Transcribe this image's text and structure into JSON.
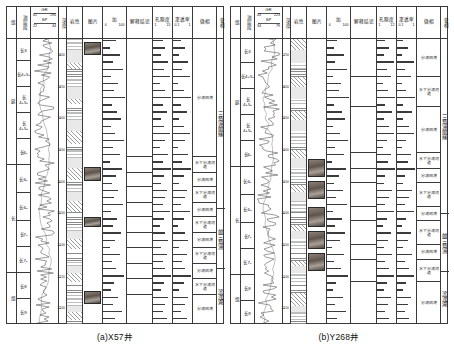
{
  "figure": {
    "panels": [
      {
        "id": "a",
        "caption": "(a)X57井",
        "headers": [
          {
            "name": "group-header",
            "label": "组",
            "type": "vertical"
          },
          {
            "name": "layer-header",
            "label": "油层段",
            "type": "vertical"
          },
          {
            "name": "curve-header",
            "label": "GR",
            "type": "curve",
            "curves": [
              {
                "name": "GR",
                "min": "61",
                "max": "190"
              },
              {
                "name": "SP",
                "min": "22",
                "max": "44"
              }
            ]
          },
          {
            "name": "depth-header",
            "label": "深度",
            "type": "vertical"
          },
          {
            "name": "lithology-header",
            "label": "岩性",
            "type": "plain"
          },
          {
            "name": "photo-header",
            "label": "图片",
            "type": "plain"
          },
          {
            "name": "gr-curve-header",
            "label": "加",
            "type": "scale",
            "min": "0",
            "max": "100"
          },
          {
            "name": "interp-header",
            "label": "解释结论",
            "type": "plain"
          },
          {
            "name": "porosity-header",
            "label": "孔隙度",
            "type": "scale",
            "min": "1",
            "max": "15"
          },
          {
            "name": "perm-header",
            "label": "渗透率",
            "type": "scale",
            "min": "0.1",
            "max": "1"
          },
          {
            "name": "microfacies-header",
            "label": "微相",
            "type": "plain"
          },
          {
            "name": "subfacies-header",
            "label": "亚相",
            "type": "vertical"
          }
        ],
        "stratigraphy": {
          "groups": [
            {
              "label": "延",
              "span": 5
            },
            {
              "label": "长",
              "span": 4
            },
            {
              "label": "组",
              "span": 3
            }
          ],
          "zones": [
            {
              "label": "长3",
              "h": 22
            },
            {
              "label": "长4+5₁",
              "h": 26
            },
            {
              "label": "长4+5₂",
              "h": 26
            },
            {
              "label": "长4+5₃",
              "h": 26
            },
            {
              "label": "长6₁",
              "h": 26
            },
            {
              "label": "长6₂",
              "h": 28
            },
            {
              "label": "长6₃",
              "h": 28
            },
            {
              "label": "长7₁",
              "h": 26
            },
            {
              "label": "长7₂",
              "h": 26
            },
            {
              "label": "长8",
              "h": 26
            },
            {
              "label": "长9",
              "h": 25
            }
          ]
        },
        "depth_labels": [
          "1800",
          "1850",
          "1900",
          "1950",
          "2000",
          "2050",
          "2100",
          "2150",
          "2200"
        ],
        "microfacies_rows": [
          {
            "label": "分流间湾",
            "top": 0,
            "h": 118
          },
          {
            "label": "水下分流河道",
            "top": 118,
            "h": 16
          },
          {
            "label": "分流间湾",
            "top": 134,
            "h": 14
          },
          {
            "label": "水下分流河道",
            "top": 148,
            "h": 16
          },
          {
            "label": "分流间湾",
            "top": 164,
            "h": 14
          },
          {
            "label": "水下分流河道",
            "top": 178,
            "h": 16
          },
          {
            "label": "分流间湾",
            "top": 194,
            "h": 15
          },
          {
            "label": "水下分流河道",
            "top": 209,
            "h": 16
          },
          {
            "label": "分流间湾",
            "top": 225,
            "h": 15
          },
          {
            "label": "水下分流河道",
            "top": 240,
            "h": 16
          },
          {
            "label": "分流间湾",
            "top": 256,
            "h": 29
          }
        ],
        "subfacies": [
          {
            "label": "三角洲前缘",
            "h": 170
          },
          {
            "label": "前三角洲",
            "h": 60
          },
          {
            "label": "滨浅湖",
            "h": 55
          }
        ],
        "photos": [
          {
            "top": 3,
            "h": 13
          },
          {
            "top": 128,
            "h": 14
          },
          {
            "top": 178,
            "h": 10
          },
          {
            "top": 252,
            "h": 13
          }
        ],
        "porosity_values": [
          7,
          9,
          6,
          11,
          8,
          12,
          5,
          9,
          13,
          7,
          10,
          6,
          8,
          12,
          9,
          5,
          11,
          7,
          13,
          8,
          6,
          10,
          9,
          7,
          12,
          8,
          5,
          9,
          11,
          6,
          10,
          7,
          9,
          13,
          8,
          6,
          11,
          9,
          7,
          10
        ],
        "perm_values": [
          5,
          8,
          4,
          10,
          6,
          11,
          3,
          7,
          12,
          5,
          9,
          4,
          7,
          11,
          8,
          3,
          10,
          6,
          12,
          7,
          4,
          9,
          8,
          5,
          11,
          7,
          3,
          8,
          10,
          4,
          9,
          6,
          8,
          12,
          7,
          4,
          10,
          8,
          5,
          9
        ],
        "interp_values": [
          12,
          6,
          15,
          9,
          18,
          7,
          14,
          10,
          20,
          8,
          13,
          16,
          7,
          11,
          19,
          9,
          15,
          6,
          17,
          12,
          8,
          14,
          10,
          18,
          7,
          13,
          9,
          16,
          11,
          6,
          15,
          8,
          12,
          19,
          10,
          7,
          14,
          9,
          17,
          11
        ]
      },
      {
        "id": "b",
        "caption": "(b)Y268井",
        "headers": [
          {
            "name": "group-header",
            "label": "组",
            "type": "vertical"
          },
          {
            "name": "layer-header",
            "label": "油层段",
            "type": "vertical"
          },
          {
            "name": "curve-header",
            "label": "GR",
            "type": "curve",
            "curves": [
              {
                "name": "GR",
                "min": "43",
                "max": "223"
              },
              {
                "name": "SP",
                "min": "34",
                "max": "79"
              }
            ]
          },
          {
            "name": "depth-header",
            "label": "深度",
            "type": "vertical"
          },
          {
            "name": "lithology-header",
            "label": "岩性",
            "type": "plain"
          },
          {
            "name": "photo-header",
            "label": "图片",
            "type": "plain"
          },
          {
            "name": "gr-curve-header",
            "label": "加",
            "type": "scale",
            "min": "0",
            "max": "100"
          },
          {
            "name": "interp-header",
            "label": "解释结论",
            "type": "plain"
          },
          {
            "name": "porosity-header",
            "label": "孔隙度",
            "type": "scale",
            "min": "1",
            "max": "12"
          },
          {
            "name": "perm-header",
            "label": "渗透率",
            "type": "scale",
            "min": "0.1",
            "max": "1"
          },
          {
            "name": "microfacies-header",
            "label": "微相",
            "type": "plain"
          },
          {
            "name": "subfacies-header",
            "label": "亚相",
            "type": "vertical"
          }
        ],
        "stratigraphy": {
          "groups": [
            {
              "label": "延",
              "span": 5
            },
            {
              "label": "长",
              "span": 4
            },
            {
              "label": "组",
              "span": 3
            }
          ],
          "zones": [
            {
              "label": "长3",
              "h": 24
            },
            {
              "label": "长4+5₁",
              "h": 26
            },
            {
              "label": "长4+5₂",
              "h": 26
            },
            {
              "label": "长4+5₃",
              "h": 26
            },
            {
              "label": "长6₁",
              "h": 26
            },
            {
              "label": "长6₂",
              "h": 28
            },
            {
              "label": "长6₃",
              "h": 28
            },
            {
              "label": "长7₁",
              "h": 26
            },
            {
              "label": "长7₂",
              "h": 26
            },
            {
              "label": "长8",
              "h": 26
            },
            {
              "label": "长9",
              "h": 23
            }
          ]
        },
        "depth_labels": [
          "1750",
          "1800",
          "1850",
          "1900",
          "1950",
          "2000",
          "2050",
          "2100",
          "2150"
        ],
        "microfacies_rows": [
          {
            "label": "分流间湾",
            "top": 0,
            "h": 38
          },
          {
            "label": "水下分流河道",
            "top": 38,
            "h": 30
          },
          {
            "label": "分流间湾",
            "top": 68,
            "h": 46
          },
          {
            "label": "水下分流河道",
            "top": 114,
            "h": 16
          },
          {
            "label": "分流间湾",
            "top": 130,
            "h": 14
          },
          {
            "label": "水下分流河道",
            "top": 144,
            "h": 24
          },
          {
            "label": "分流间湾",
            "top": 168,
            "h": 14
          },
          {
            "label": "水下分流河道",
            "top": 182,
            "h": 24
          },
          {
            "label": "分流间湾",
            "top": 206,
            "h": 15
          },
          {
            "label": "水下分流河道",
            "top": 221,
            "h": 22
          },
          {
            "label": "分流间湾",
            "top": 243,
            "h": 42
          }
        ],
        "subfacies": [
          {
            "label": "三角洲前缘",
            "h": 175
          },
          {
            "label": "前三角洲",
            "h": 58
          },
          {
            "label": "滨浅湖",
            "h": 52
          }
        ],
        "photos": [
          {
            "top": 120,
            "h": 18
          },
          {
            "top": 142,
            "h": 18
          },
          {
            "top": 168,
            "h": 20
          },
          {
            "top": 192,
            "h": 18
          },
          {
            "top": 214,
            "h": 18
          }
        ],
        "porosity_values": [
          6,
          9,
          5,
          12,
          7,
          10,
          4,
          8,
          13,
          6,
          11,
          5,
          9,
          12,
          7,
          4,
          10,
          8,
          13,
          6,
          5,
          11,
          9,
          6,
          12,
          7,
          4,
          10,
          8,
          5,
          11,
          6,
          9,
          12,
          7,
          5,
          10,
          8,
          6,
          9
        ],
        "perm_values": [
          4,
          7,
          3,
          11,
          5,
          9,
          3,
          6,
          12,
          4,
          10,
          4,
          8,
          11,
          6,
          3,
          9,
          7,
          12,
          5,
          4,
          10,
          8,
          5,
          11,
          6,
          3,
          9,
          7,
          4,
          10,
          5,
          8,
          11,
          6,
          4,
          9,
          7,
          5,
          8
        ],
        "interp_values": [
          10,
          7,
          16,
          8,
          19,
          6,
          13,
          11,
          21,
          7,
          14,
          17,
          6,
          12,
          20,
          8,
          16,
          5,
          18,
          11,
          7,
          15,
          9,
          19,
          6,
          14,
          8,
          17,
          12,
          5,
          16,
          7,
          13,
          20,
          9,
          6,
          15,
          8,
          18,
          10
        ]
      }
    ]
  },
  "colors": {
    "ink": "#3a3a3a",
    "bar": "#3b3b3b",
    "curve": "#1f1f1f",
    "photo": "#6b6257"
  }
}
